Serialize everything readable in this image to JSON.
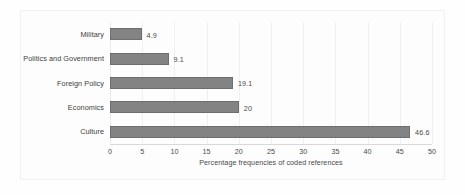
{
  "chart_data": {
    "type": "bar",
    "orientation": "horizontal",
    "title": "",
    "subtitle": "",
    "xlabel": "Percentage frequencies of coded references",
    "ylabel": "",
    "categories": [
      "Military",
      "Politics and Government",
      "Foreign Policy",
      "Economics",
      "Culture"
    ],
    "values": [
      4.9,
      9.1,
      19.1,
      20,
      46.6
    ],
    "value_labels": [
      "4.9",
      "9.1",
      "19.1",
      "20",
      "46.6"
    ],
    "xlim": [
      0,
      50
    ],
    "xticks": [
      0,
      5,
      10,
      15,
      20,
      25,
      30,
      35,
      40,
      45,
      50
    ],
    "xtick_labels": [
      "0",
      "5",
      "10",
      "15",
      "20",
      "25",
      "30",
      "35",
      "40",
      "45",
      "50"
    ],
    "grid": "vertical",
    "legend": "none",
    "series": [
      {
        "name": "Percentage frequencies of coded references",
        "values": [
          4.9,
          9.1,
          19.1,
          20,
          46.6
        ]
      }
    ],
    "colors": {
      "bar_fill": "#838383",
      "bar_border": "#6e6e6e",
      "gridline": "#f0f0f0",
      "axis_line": "#d9d9d9",
      "text": "#4a4a4a",
      "background": "#fdfdfd",
      "frame": "#f1f1f1"
    }
  }
}
